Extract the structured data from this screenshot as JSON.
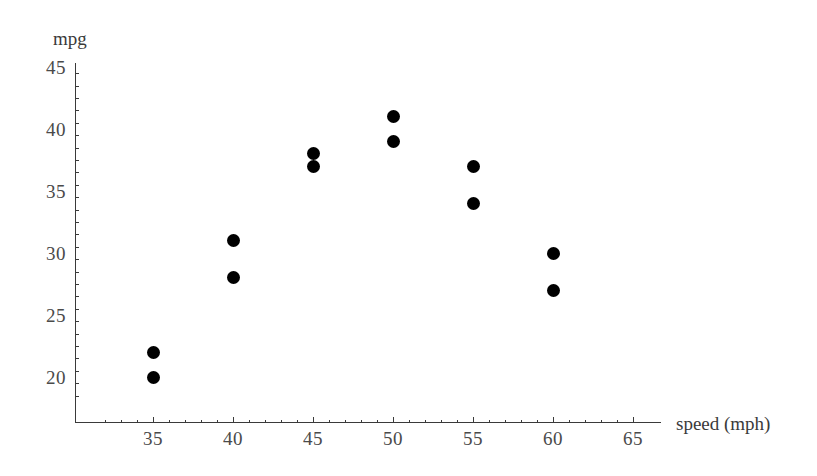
{
  "chart_data": {
    "type": "scatter",
    "title": "",
    "xlabel": "speed (mph)",
    "ylabel": "mpg",
    "xlim": [
      32,
      65
    ],
    "ylim": [
      18.5,
      45
    ],
    "grid": false,
    "legend": "none",
    "x_ticks": [
      35,
      40,
      45,
      50,
      55,
      60,
      65
    ],
    "x_tick_labels": [
      "35",
      "40",
      "45",
      "50",
      "55",
      "60",
      "65"
    ],
    "x_minor_step": 1,
    "y_ticks": [
      20,
      25,
      30,
      35,
      40,
      45
    ],
    "y_tick_labels": [
      "20",
      "25",
      "30",
      "35",
      "40",
      "45"
    ],
    "y_minor_step": 1,
    "marker": "filled-circle",
    "marker_color": "#000000",
    "axis_color": "#3a3a3a",
    "background_color": "#ffffff",
    "points": [
      {
        "x": 35,
        "y": 22
      },
      {
        "x": 35,
        "y": 20
      },
      {
        "x": 40,
        "y": 31
      },
      {
        "x": 40,
        "y": 28
      },
      {
        "x": 45,
        "y": 38
      },
      {
        "x": 45,
        "y": 37
      },
      {
        "x": 50,
        "y": 41
      },
      {
        "x": 50,
        "y": 39
      },
      {
        "x": 55,
        "y": 37
      },
      {
        "x": 55,
        "y": 34
      },
      {
        "x": 60,
        "y": 30
      },
      {
        "x": 60,
        "y": 27
      }
    ]
  }
}
